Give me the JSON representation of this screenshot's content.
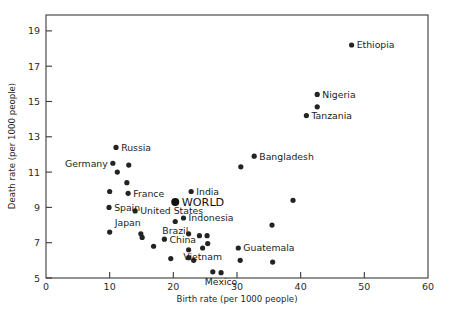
{
  "chart_data": {
    "type": "scatter",
    "title": "",
    "xlabel": "Birth rate (per 1000 people)",
    "ylabel": "Death rate (per 1000 people)",
    "xlim": [
      0,
      60
    ],
    "ylim": [
      5,
      19.9
    ],
    "xticks": [
      0,
      10,
      20,
      30,
      40,
      50,
      60
    ],
    "yticks": [
      5,
      7,
      9,
      11,
      13,
      15,
      17,
      19
    ],
    "xtick_labels": [
      "0",
      "10",
      "20",
      "30",
      "40",
      "50",
      "60"
    ],
    "ytick_labels": [
      "5",
      "7",
      "9",
      "11",
      "13",
      "15",
      "17",
      "19"
    ],
    "grid": false,
    "legend": "none",
    "points": [
      {
        "label": "Ethiopia",
        "x": 48.0,
        "y": 18.2,
        "lx": 1,
        "ly": 0,
        "size": 2.6,
        "anchor": "start"
      },
      {
        "label": "Nigeria",
        "x": 42.6,
        "y": 15.4,
        "lx": 1,
        "ly": 0,
        "size": 2.6,
        "anchor": "start"
      },
      {
        "label": "",
        "x": 42.6,
        "y": 14.7,
        "lx": 0,
        "ly": 0,
        "size": 2.6,
        "anchor": "start"
      },
      {
        "label": "Tanzania",
        "x": 40.9,
        "y": 14.2,
        "lx": 1,
        "ly": 0,
        "size": 2.6,
        "anchor": "start"
      },
      {
        "label": "Bangladesh",
        "x": 32.7,
        "y": 11.9,
        "lx": 1,
        "ly": 0,
        "size": 2.6,
        "anchor": "start"
      },
      {
        "label": "",
        "x": 30.6,
        "y": 11.3,
        "lx": 0,
        "ly": 0,
        "size": 2.6,
        "anchor": "start"
      },
      {
        "label": "Russia",
        "x": 11.0,
        "y": 12.4,
        "lx": 1,
        "ly": 0,
        "size": 2.6,
        "anchor": "start"
      },
      {
        "label": "Germany",
        "x": 10.5,
        "y": 11.5,
        "lx": -1,
        "ly": 0,
        "size": 2.6,
        "anchor": "end"
      },
      {
        "label": "",
        "x": 11.2,
        "y": 11.0,
        "lx": 0,
        "ly": 0,
        "size": 2.6,
        "anchor": "start"
      },
      {
        "label": "",
        "x": 13.0,
        "y": 11.4,
        "lx": 0,
        "ly": 0,
        "size": 2.6,
        "anchor": "start"
      },
      {
        "label": "",
        "x": 12.7,
        "y": 10.4,
        "lx": 0,
        "ly": 0,
        "size": 2.6,
        "anchor": "start"
      },
      {
        "label": "",
        "x": 10.0,
        "y": 9.9,
        "lx": 0,
        "ly": 0,
        "size": 2.6,
        "anchor": "start"
      },
      {
        "label": "France",
        "x": 12.9,
        "y": 9.8,
        "lx": 1,
        "ly": 0,
        "size": 2.6,
        "anchor": "start"
      },
      {
        "label": "Spain",
        "x": 9.9,
        "y": 9.0,
        "lx": 1,
        "ly": 0,
        "size": 2.6,
        "anchor": "start"
      },
      {
        "label": "United States",
        "x": 14.0,
        "y": 8.8,
        "lx": 1,
        "ly": 0,
        "size": 2.6,
        "anchor": "start"
      },
      {
        "label": "India",
        "x": 22.8,
        "y": 9.9,
        "lx": 1,
        "ly": 0,
        "size": 2.6,
        "anchor": "start"
      },
      {
        "label": "WORLD",
        "x": 20.3,
        "y": 9.3,
        "lx": 1,
        "ly": 0,
        "size": 4.0,
        "anchor": "start"
      },
      {
        "label": "Indonesia",
        "x": 21.6,
        "y": 8.4,
        "lx": 1,
        "ly": 0,
        "size": 2.6,
        "anchor": "start"
      },
      {
        "label": "Brazil",
        "x": 20.3,
        "y": 8.2,
        "lx": -1,
        "ly": 1,
        "size": 2.6,
        "anchor": "middle"
      },
      {
        "label": "Japan",
        "x": 10.0,
        "y": 7.6,
        "lx": 1,
        "ly": -1,
        "size": 2.6,
        "anchor": "start"
      },
      {
        "label": "China",
        "x": 18.6,
        "y": 7.2,
        "lx": 1,
        "ly": 0,
        "size": 2.6,
        "anchor": "start"
      },
      {
        "label": "",
        "x": 14.9,
        "y": 7.5,
        "lx": 0,
        "ly": 0,
        "size": 2.6,
        "anchor": "start"
      },
      {
        "label": "",
        "x": 15.1,
        "y": 7.3,
        "lx": 0,
        "ly": 0,
        "size": 2.6,
        "anchor": "start"
      },
      {
        "label": "",
        "x": 16.9,
        "y": 6.8,
        "lx": 0,
        "ly": 0,
        "size": 2.6,
        "anchor": "start"
      },
      {
        "label": "",
        "x": 19.6,
        "y": 6.1,
        "lx": 0,
        "ly": 0,
        "size": 2.6,
        "anchor": "start"
      },
      {
        "label": "",
        "x": 23.2,
        "y": 6.0,
        "lx": 0,
        "ly": 0,
        "size": 2.6,
        "anchor": "start"
      },
      {
        "label": "",
        "x": 22.4,
        "y": 7.5,
        "lx": 0,
        "ly": 0,
        "size": 2.6,
        "anchor": "start"
      },
      {
        "label": "",
        "x": 24.1,
        "y": 7.4,
        "lx": 0,
        "ly": 0,
        "size": 2.6,
        "anchor": "start"
      },
      {
        "label": "",
        "x": 25.3,
        "y": 7.4,
        "lx": 0,
        "ly": 0,
        "size": 2.6,
        "anchor": "start"
      },
      {
        "label": "",
        "x": 25.4,
        "y": 6.95,
        "lx": 0,
        "ly": 0,
        "size": 2.6,
        "anchor": "start"
      },
      {
        "label": "Vietnam",
        "x": 24.6,
        "y": 6.7,
        "lx": 0,
        "ly": 1,
        "size": 2.6,
        "anchor": "middle"
      },
      {
        "label": "",
        "x": 22.4,
        "y": 6.6,
        "lx": 0,
        "ly": 0,
        "size": 2.6,
        "anchor": "start"
      },
      {
        "label": "",
        "x": 22.4,
        "y": 6.15,
        "lx": 0,
        "ly": 0,
        "size": 2.6,
        "anchor": "start"
      },
      {
        "label": "Mexico",
        "x": 27.5,
        "y": 5.3,
        "lx": 0,
        "ly": 1,
        "size": 2.6,
        "anchor": "middle"
      },
      {
        "label": "",
        "x": 26.2,
        "y": 5.35,
        "lx": 0,
        "ly": 0,
        "size": 2.6,
        "anchor": "start"
      },
      {
        "label": "",
        "x": 30.5,
        "y": 6.0,
        "lx": 0,
        "ly": 0,
        "size": 2.6,
        "anchor": "start"
      },
      {
        "label": "Guatemala",
        "x": 30.2,
        "y": 6.7,
        "lx": 1,
        "ly": 0,
        "size": 2.6,
        "anchor": "start"
      },
      {
        "label": "",
        "x": 35.6,
        "y": 5.9,
        "lx": 0,
        "ly": 0,
        "size": 2.6,
        "anchor": "start"
      },
      {
        "label": "",
        "x": 35.5,
        "y": 8.0,
        "lx": 0,
        "ly": 0,
        "size": 2.6,
        "anchor": "start"
      },
      {
        "label": "",
        "x": 38.8,
        "y": 9.4,
        "lx": 0,
        "ly": 0,
        "size": 2.6,
        "anchor": "start"
      }
    ]
  },
  "axis": {
    "x_title": "Birth rate (per 1000 people)",
    "y_title": "Death rate (per 1000 people)"
  },
  "colors": {
    "point": "#232323",
    "frame": "#3a3a3a",
    "background": "#ffffff",
    "text": "#1c1c1c"
  }
}
